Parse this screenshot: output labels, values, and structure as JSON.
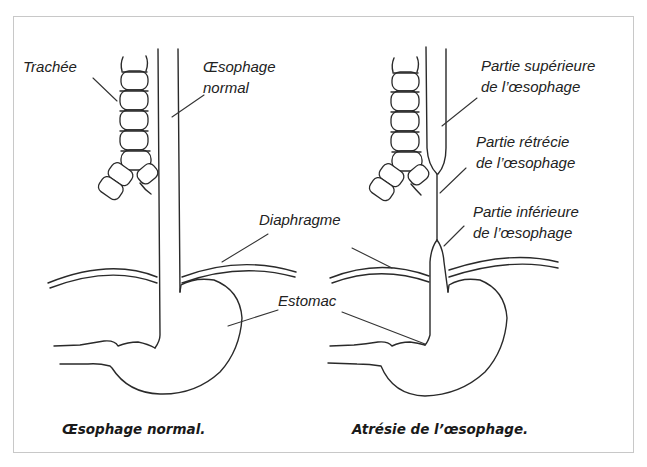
{
  "left_panel": {
    "labels": {
      "trachea": "Trachée",
      "esophagus_line1": "Œsophage",
      "esophagus_line2": "normal",
      "diaphragm": "Diaphragme",
      "stomach": "Estomac"
    },
    "caption": "Œsophage normal."
  },
  "right_panel": {
    "labels": {
      "upper_line1": "Partie supérieure",
      "upper_line2": "de l’œsophage",
      "narrowed_line1": "Partie rétrécie",
      "narrowed_line2": "de l’œsophage",
      "lower_line1": "Partie inférieure",
      "lower_line2": "de l’œsophage"
    },
    "caption": "Atrésie de l’œsophage."
  },
  "colors": {
    "line": "#2a2a2a",
    "frame": "#c8c8c8",
    "background": "#ffffff"
  }
}
